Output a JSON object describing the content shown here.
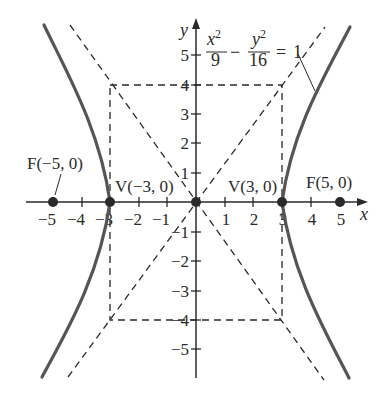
{
  "diagram": {
    "type": "hyperbola",
    "equation": {
      "lhs_term1": {
        "numerator_var": "x",
        "numerator_exp": "2",
        "denominator": "9"
      },
      "operator": "−",
      "lhs_term2": {
        "numerator_var": "y",
        "numerator_exp": "2",
        "denominator": "16"
      },
      "equals": "=",
      "rhs": "1"
    },
    "a": 3,
    "b": 4,
    "c": 5,
    "axes": {
      "x_label": "x",
      "y_label": "y",
      "x_ticks": [
        "−5",
        "−4",
        "−3",
        "−2",
        "−1",
        "1",
        "2",
        "3",
        "4",
        "5"
      ],
      "y_ticks": [
        "5",
        "4",
        "3",
        "2",
        "1",
        "−1",
        "−2",
        "−3",
        "−4",
        "−5"
      ]
    },
    "points": [
      {
        "name": "F",
        "label": "F(−5, 0)",
        "x": -5,
        "y": 0
      },
      {
        "name": "V",
        "label": "V(−3, 0)",
        "x": -3,
        "y": 0
      },
      {
        "name": "O",
        "label": "",
        "x": 0,
        "y": 0
      },
      {
        "name": "V",
        "label": "V(3, 0)",
        "x": 3,
        "y": 0
      },
      {
        "name": "F",
        "label": "F(5, 0)",
        "x": 5,
        "y": 0
      }
    ],
    "asymptotes": [
      "y = 4x/3",
      "y = −4x/3"
    ],
    "fundamental_rectangle": {
      "x_range": [
        -3,
        3
      ],
      "y_range": [
        -4,
        4
      ]
    },
    "colors": {
      "curve": "#555555",
      "lines": "#2a2a2a",
      "background": "#ffffff"
    }
  }
}
